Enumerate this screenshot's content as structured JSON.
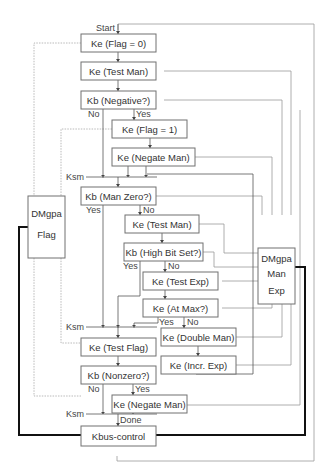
{
  "diagram": {
    "type": "flowchart",
    "labels": {
      "start": "Start",
      "done": "Done",
      "ksm": "Ksm",
      "yes": "Yes",
      "no": "No"
    },
    "nodes": {
      "flag0": "Ke (Flag = 0)",
      "testman1": "Ke (Test Man)",
      "negative": "Kb (Negative?)",
      "flag1": "Ke (Flag = 1)",
      "negateman1": "Ke (Negate Man)",
      "manzero": "Kb (Man Zero?)",
      "testman2": "Ke (Test Man)",
      "highbit": "Kb (High Bit Set?)",
      "testexp": "Ke (Test Exp)",
      "atmax": "Ke (At Max?)",
      "doubleman": "Ke (Double Man)",
      "increxp": "Ke (Incr. Exp)",
      "testflag": "Ke (Test Flag)",
      "nonzero": "Kb (Nonzero?)",
      "negateman2": "Ke (Negate Man)",
      "kbus": "Kbus-control",
      "dmgpa_flag_1": "DMgpa",
      "dmgpa_flag_2": "Flag",
      "dmgpa_me_1": "DMgpa",
      "dmgpa_me_2": "Man",
      "dmgpa_me_3": "Exp"
    }
  }
}
